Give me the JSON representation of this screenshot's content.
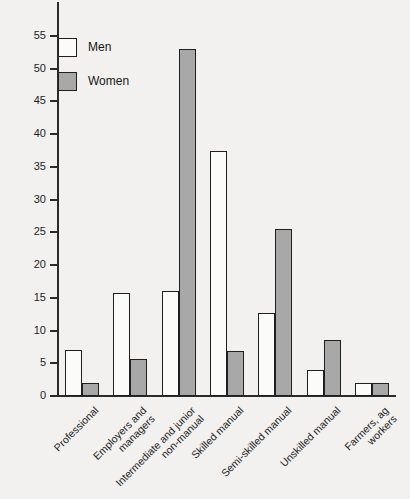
{
  "chart_data": {
    "type": "bar",
    "title": "",
    "xlabel": "",
    "ylabel": "",
    "ylim": [
      0,
      57
    ],
    "grid": false,
    "legend_position": "top-left",
    "categories": [
      "Professional",
      "Employers and\nmanagers",
      "Intermediate and junior\nnon-manual",
      "Skilled manual",
      "Semi-skilled manual",
      "Unskilled manual",
      "Farmers, ag\nworkers"
    ],
    "yticks": [
      0,
      5,
      10,
      15,
      20,
      25,
      30,
      35,
      40,
      45,
      50,
      55
    ],
    "ytick_labels": [
      "0",
      "5",
      "10",
      "15",
      "20",
      "25",
      "30",
      "35",
      "40",
      "45",
      "50",
      "55"
    ],
    "series": [
      {
        "name": "Men",
        "color": "#fbfbfa",
        "values": [
          7,
          15.8,
          16,
          37.5,
          12.7,
          4,
          2
        ]
      },
      {
        "name": "Women",
        "color": "#a8a8a8",
        "values": [
          2,
          5.6,
          53,
          6.8,
          25.5,
          8.5,
          2
        ]
      }
    ]
  },
  "legend": {
    "items": [
      {
        "label": "Men",
        "swatch": "men"
      },
      {
        "label": "Women",
        "swatch": "women"
      }
    ]
  },
  "axis": {
    "y_caption": ""
  }
}
